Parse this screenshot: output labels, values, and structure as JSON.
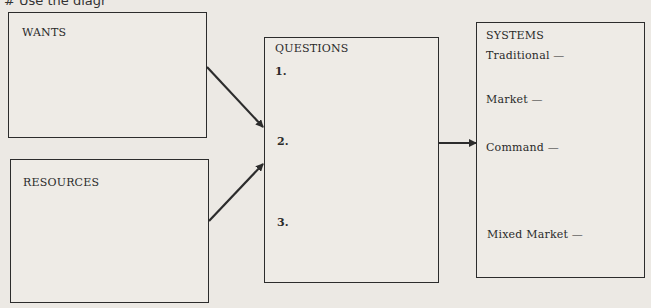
{
  "instruction_partial": "#    Use the diagr",
  "wants_box": {
    "title": "WANTS"
  },
  "resources_box": {
    "title": "RESOURCES"
  },
  "questions_box": {
    "title": "QUESTIONS",
    "items": [
      "1.",
      "2.",
      "3."
    ]
  },
  "systems_box": {
    "title": "SYSTEMS",
    "items": [
      "Traditional —",
      "Market —",
      "Command —",
      "Mixed Market —"
    ]
  }
}
